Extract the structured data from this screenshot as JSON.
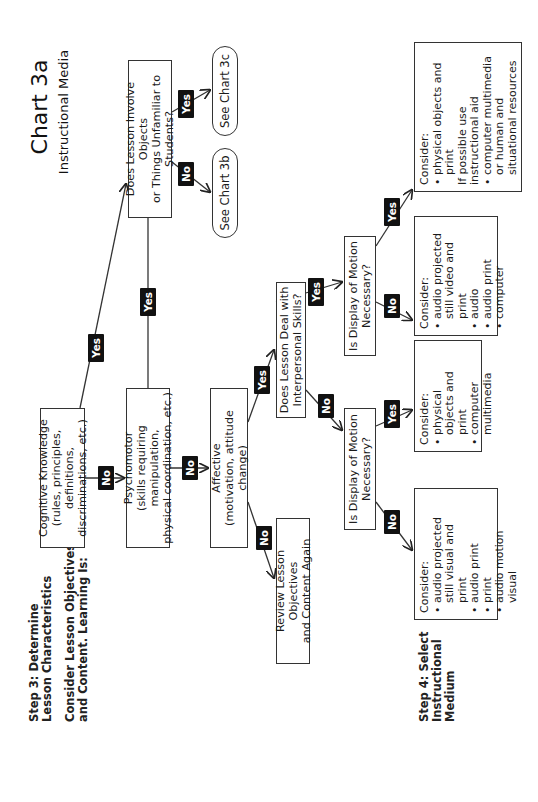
{
  "header": {
    "title": "Chart 3a",
    "subtitle": "Instructional Media"
  },
  "steps": {
    "step3_title_line1": "Step 3: Determine",
    "step3_title_line2": "Lesson Characteristics",
    "step3_prompt_line1": "Consider Lesson Objectives",
    "step3_prompt_line2": "and Content. Learning Is:",
    "step4_line1": "Step 4: Select",
    "step4_line2": "Instructional",
    "step4_line3": "Medium"
  },
  "nodes": {
    "cognitive": {
      "line1": "Cognitive Knowledge",
      "line2": "(rules, principles, definitions,",
      "line3": "discriminations, etc.)"
    },
    "psychomotor": {
      "line1": "Psychomotor",
      "line2": "(skills requiring manipulation,",
      "line3": "physical coordination, etc.)"
    },
    "affective": {
      "line1": "Affective",
      "line2": "(motivation, attitude change)"
    },
    "review": {
      "line1": "Review Lesson Objectives",
      "line2": "and Content Again"
    },
    "objects_question": {
      "line1": "Does Lesson Involve Objects",
      "line2": "or Things Unfamiliar to",
      "line3": "Students?"
    },
    "see_chart_3b": "See Chart 3b",
    "see_chart_3c": "See Chart 3c",
    "interpersonal_question": {
      "line1": "Does Lesson Deal with",
      "line2": "Interpersonal Skills?"
    },
    "motion_question_left": {
      "line1": "Is  Display of Motion",
      "line2": "Necessary?"
    },
    "motion_question_right": {
      "line1": "Is  Display of Motion",
      "line2": "Necessary?"
    }
  },
  "consider_boxes": [
    {
      "heading": "Consider:",
      "items": [
        {
          "text": "audio projected still visual and print",
          "bullet": true
        },
        {
          "text": "audio print",
          "bullet": true
        },
        {
          "text": "print",
          "bullet": true
        },
        {
          "text": "audio motion visual",
          "bullet": true
        }
      ]
    },
    {
      "heading": "Consider:",
      "items": [
        {
          "text": "physical objects and print",
          "bullet": true
        },
        {
          "text": "computer multimedia",
          "bullet": true
        }
      ]
    },
    {
      "heading": "Consider:",
      "items": [
        {
          "text": "audio projected still video and print",
          "bullet": true
        },
        {
          "text": "audio",
          "bullet": true
        },
        {
          "text": "audio print",
          "bullet": true
        },
        {
          "text": "computer",
          "bullet": true
        }
      ]
    },
    {
      "heading": "Consider:",
      "items": [
        {
          "text": "physical objects and print",
          "bullet": true
        },
        {
          "text": "If possible use instructional aid",
          "bullet": false
        },
        {
          "text": "computer multimedia or human and situational resources",
          "bullet": true
        }
      ]
    }
  ],
  "edge_labels": {
    "yes": "Yes",
    "no": "No"
  },
  "colors": {
    "line": "#333333",
    "tag_bg": "#111111",
    "tag_text": "#ffffff",
    "background": "#ffffff"
  }
}
